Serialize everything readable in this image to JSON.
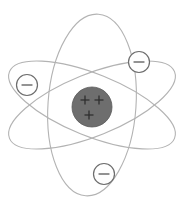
{
  "figure": {
    "title": "Atom diagram",
    "width": 184,
    "height": 206,
    "background_color": "#ffffff"
  },
  "nucleus": {
    "label": "nucleus",
    "center_x": 92,
    "center_y": 107,
    "radius": 20,
    "fill_color": "#6e6e6e",
    "stroke_color": "#5a5a5a",
    "charge_symbol": "+",
    "charge_count": 3,
    "protons": [
      {
        "label": "+",
        "x": 85,
        "y": 100
      },
      {
        "label": "+",
        "x": 99,
        "y": 100
      },
      {
        "label": "+",
        "x": 89,
        "y": 115
      }
    ]
  },
  "electrons": [
    {
      "label": "electron-left",
      "charge_symbol": "−",
      "center_x": 27,
      "center_y": 85,
      "radius": 10.5,
      "fill_color": "#fefefe",
      "stroke_color": "#6d6d6d"
    },
    {
      "label": "electron-top-right",
      "charge_symbol": "−",
      "center_x": 139,
      "center_y": 62,
      "radius": 10.5,
      "fill_color": "#fefefe",
      "stroke_color": "#6d6d6d"
    },
    {
      "label": "electron-bottom",
      "charge_symbol": "−",
      "center_x": 104,
      "center_y": 174,
      "radius": 10.5,
      "fill_color": "#fefefe",
      "stroke_color": "#6d6d6d"
    }
  ],
  "orbits": [
    {
      "label": "orbit-vertical",
      "center_x": 92,
      "center_y": 105,
      "radius_x": 44,
      "radius_y": 91,
      "rotation_deg": 4,
      "stroke_color": "#b3b3b3",
      "stroke_width": 1.1
    },
    {
      "label": "orbit-diagonal-descending",
      "center_x": 92,
      "center_y": 105,
      "radius_x": 89,
      "radius_y": 31,
      "rotation_deg": -22,
      "stroke_color": "#b3b3b3",
      "stroke_width": 1.1
    },
    {
      "label": "orbit-diagonal-ascending",
      "center_x": 92,
      "center_y": 105,
      "radius_x": 89,
      "radius_y": 31,
      "rotation_deg": 22,
      "stroke_color": "#b3b3b3",
      "stroke_width": 1.1
    }
  ],
  "colors": {
    "orbit_line": "#b3b3b3",
    "nucleus_fill": "#6e6e6e",
    "electron_fill": "#fefefe",
    "electron_stroke": "#6d6d6d",
    "sign_stroke": "#4a4a4a",
    "background": "#ffffff"
  }
}
